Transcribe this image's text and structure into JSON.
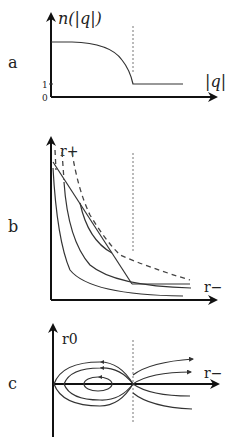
{
  "panels": [
    {
      "id": "a",
      "label": "a",
      "y_axis_label": "n(|q|)",
      "x_axis_label": "|q|",
      "y_ticks": [
        "1",
        "0"
      ],
      "description": "n(|q|) flat plateau, decreasing to 1 at critical |q| (dotted line), constant 1 after"
    },
    {
      "id": "b",
      "label": "b",
      "y_axis_label": "r+",
      "x_axis_label": "r−",
      "description": "Family of decreasing curves in (r−, r+) plane with straight boundary line and dashed envelope; dotted vertical line at critical r−"
    },
    {
      "id": "c",
      "label": "c",
      "y_axis_label": "r0",
      "x_axis_label": "r−",
      "description": "Phase portrait: closed orbits around fixed point left of dotted line, open flow lines to the right"
    }
  ]
}
